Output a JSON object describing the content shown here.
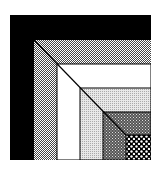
{
  "figure": {
    "bands": [
      {
        "name": "black",
        "fill": "#000000"
      },
      {
        "name": "gray-dither",
        "fill": "#9a9a9a"
      },
      {
        "name": "white",
        "fill": "#ffffff"
      },
      {
        "name": "light-gray",
        "fill": "#d4d4d4"
      },
      {
        "name": "medium-dither",
        "fill": "#7a7a7a"
      },
      {
        "name": "dots",
        "fill": "#222222"
      }
    ]
  }
}
